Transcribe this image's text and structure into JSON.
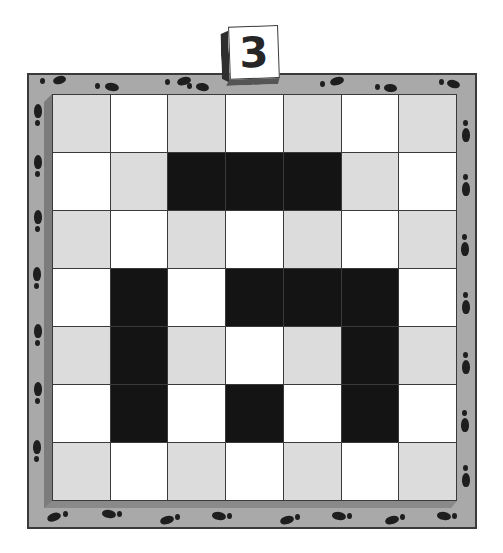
{
  "puzzle": {
    "level_number": "3",
    "rows": 7,
    "cols": 7,
    "grid": [
      [
        "gray",
        "white",
        "gray",
        "white",
        "gray",
        "white",
        "gray"
      ],
      [
        "white",
        "gray",
        "black",
        "black",
        "black",
        "gray",
        "white"
      ],
      [
        "gray",
        "white",
        "gray",
        "white",
        "gray",
        "white",
        "gray"
      ],
      [
        "white",
        "black",
        "white",
        "black",
        "black",
        "black",
        "white"
      ],
      [
        "gray",
        "black",
        "gray",
        "white",
        "gray",
        "black",
        "gray"
      ],
      [
        "white",
        "black",
        "white",
        "black",
        "white",
        "black",
        "white"
      ],
      [
        "gray",
        "white",
        "gray",
        "white",
        "gray",
        "white",
        "gray"
      ]
    ]
  },
  "colors": {
    "frame": "#a9a9a9",
    "frame_outline": "#3a3a3a",
    "cell_gray": "#dcdcdc",
    "cell_white": "#ffffff",
    "cell_black": "#141414",
    "footprint": "#1e1e1e"
  },
  "decor": {
    "border_icon": "footprint-icon"
  }
}
